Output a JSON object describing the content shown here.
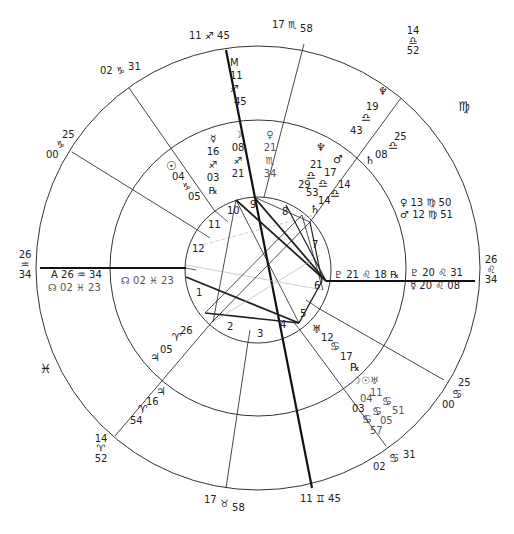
{
  "chart_title": "",
  "wheel": {
    "center": [
      258,
      268
    ],
    "outer_radius": 222,
    "middle_radius": 148,
    "inner_radius": 73,
    "line_color": "#222222",
    "background": "#ffffff"
  },
  "outer_cusps": [
    {
      "id": "mc",
      "deg": "11",
      "sign": "♐",
      "min": "45",
      "x": 200,
      "y": 32
    },
    {
      "id": "c11",
      "deg": "17",
      "sign": "♏",
      "min": "58",
      "x": 324,
      "y": 16
    },
    {
      "id": "c12",
      "deg": "14",
      "sign": "♎",
      "min": "52",
      "x": 398,
      "y": 46
    },
    {
      "id": "c9",
      "deg": "02",
      "sign": "♑",
      "min": "31",
      "x": 100,
      "y": 64
    },
    {
      "id": "c8",
      "deg": "00",
      "sign": "♑",
      "min": "25",
      "x": 46,
      "y": 130
    },
    {
      "id": "asc_left",
      "deg": "26",
      "sign": "♒",
      "min": "34",
      "x": 18,
      "y": 258
    },
    {
      "id": "asc_right",
      "deg": "26",
      "sign": "♌",
      "min": "34",
      "x": 482,
      "y": 266
    },
    {
      "id": "c5",
      "deg": "14",
      "sign": "♈",
      "min": "52",
      "x": 92,
      "y": 432
    },
    {
      "id": "c4b",
      "deg": "17",
      "sign": "♉",
      "min": "58",
      "x": 206,
      "y": 492
    },
    {
      "id": "ic",
      "deg": "11",
      "sign": "♊",
      "min": "45",
      "x": 276,
      "y": 494
    },
    {
      "id": "c2",
      "deg": "02",
      "sign": "♋",
      "min": "31",
      "x": 376,
      "y": 452
    },
    {
      "id": "c3",
      "deg": "00",
      "sign": "♋",
      "min": "25",
      "x": 444,
      "y": 396
    }
  ],
  "sign_markers": [
    {
      "sign": "♍",
      "x": 456,
      "y": 104
    },
    {
      "sign": "♓",
      "x": 42,
      "y": 362
    }
  ],
  "mc_label": {
    "text": "M",
    "deg": "11",
    "sign": "♐",
    "min": "45"
  },
  "asc_label": {
    "text": "A",
    "deg": "26",
    "sign": "♒",
    "min": "34"
  },
  "planets": [
    {
      "name": "mercury",
      "glyph": "☿",
      "deg": "16",
      "sign": "♐",
      "min": "03",
      "retro": "℞"
    },
    {
      "name": "moon",
      "glyph": "☽",
      "deg": "08",
      "sign": "♐",
      "min": "21"
    },
    {
      "name": "venus",
      "glyph": "♀",
      "deg": "21",
      "sign": "♏",
      "min": "34"
    },
    {
      "name": "sun",
      "glyph": "☉",
      "deg": "04",
      "sign": "♑",
      "min": "05"
    },
    {
      "name": "neptune",
      "glyph": "♆",
      "deg": "21",
      "sign": "♎",
      "min": "29"
    },
    {
      "name": "mars",
      "glyph": "♂",
      "deg": "17",
      "sign": "♎",
      "min": "53"
    },
    {
      "name": "saturn",
      "glyph": "♄",
      "deg": "14",
      "sign": "♎",
      "min": "14"
    },
    {
      "name": "pluto",
      "glyph": "♇",
      "deg": "21",
      "sign": "♌",
      "min": "18",
      "retro": "℞"
    },
    {
      "name": "uranus",
      "glyph": "♅",
      "deg": "12",
      "sign": "♋",
      "min": "17",
      "retro": "℞"
    },
    {
      "name": "jupiter",
      "glyph": "♃",
      "deg": "05",
      "sign": "♈",
      "min": "26"
    },
    {
      "name": "node",
      "glyph": "☊",
      "deg": "02",
      "sign": "♓",
      "min": "23"
    }
  ],
  "outer_ring_planets": [
    {
      "name": "neptune_t",
      "glyph": "♆",
      "deg": "19",
      "sign": "♎",
      "min": "43"
    },
    {
      "name": "saturn_t",
      "glyph": "♄",
      "deg": "08",
      "sign": "♎",
      "min": "25"
    },
    {
      "name": "venus_t",
      "glyph": "♀",
      "deg": "13",
      "sign": "♍",
      "min": "50"
    },
    {
      "name": "mars_t",
      "glyph": "♂",
      "deg": "12",
      "sign": "♍",
      "min": "51"
    },
    {
      "name": "pluto_t",
      "glyph": "♇",
      "deg": "20",
      "sign": "♌",
      "min": "31"
    },
    {
      "name": "mercury_t",
      "glyph": "☿",
      "deg": "20",
      "sign": "♌",
      "min": "08"
    },
    {
      "name": "jupiter_t",
      "glyph": "♃",
      "deg": "16",
      "sign": "♈",
      "min": "54"
    },
    {
      "name": "node_t",
      "glyph": "☊",
      "deg": "02",
      "sign": "♓",
      "min": "23"
    },
    {
      "name": "moon_t",
      "glyph": "☽",
      "deg": "03",
      "sign": "♋",
      "min": "57"
    },
    {
      "name": "sun_t",
      "glyph": "☉",
      "deg": "04",
      "sign": "♋",
      "min": "05"
    },
    {
      "name": "uranus_t",
      "glyph": "♅",
      "deg": "11",
      "sign": "♋",
      "min": "51"
    }
  ],
  "house_numbers": [
    "1",
    "2",
    "3",
    "4",
    "5",
    "6",
    "7",
    "8",
    "9",
    "10",
    "11",
    "12"
  ],
  "labels": {
    "mc_m": "M",
    "mc_deg": "11",
    "mc_sign": "♐",
    "mc_min": "45",
    "asc_a": "A",
    "asc_deg": "26",
    "asc_sign": "♒",
    "asc_min": "34",
    "node_inner": "☊ 02 ♓ 23",
    "node_outer": "☊ 02 ♓ 23",
    "pluto_row": "♇ 21 ♌ 18 ℞",
    "t_pluto_row": "♇ 20 ♌ 31",
    "t_merc_row": "☿ 20 ♌ 08",
    "venus_t_row": "♀ 13 ♍ 50",
    "mars_t_row": "♂ 12 ♍ 51",
    "uranus_glyph": "♅",
    "uranus_deg": "12",
    "uranus_sign": "♋",
    "uranus_min": "17",
    "uranus_retro": "℞",
    "sun_glyph": "☉",
    "sun_deg": "04",
    "sun_sign": "♑",
    "sun_min": "05",
    "merc_glyph": "☿",
    "merc_deg": "16",
    "merc_sign": "♐",
    "merc_min": "03",
    "merc_retro": "℞",
    "moon_glyph": "☽",
    "moon_deg": "08",
    "moon_sign": "♐",
    "moon_min": "21",
    "venus_glyph": "♀",
    "venus_deg": "21",
    "venus_sign": "♏",
    "venus_min": "34",
    "nep_glyph": "♆",
    "nep_deg": "21",
    "mars_glyph": "♂",
    "mars_deg": "17",
    "libra": "♎",
    "nep_min": "29",
    "mars_min": "53",
    "sat_deg": "14",
    "sat_min": "14",
    "sat_glyph": "♄",
    "nep_t_glyph": "♆",
    "nep_t_deg": "19",
    "nep_t_min": "43",
    "sat_t_glyph": "♄",
    "sat_t_deg": "08",
    "sat_t_min": "25",
    "jup_glyph": "♃",
    "jup_deg": "05",
    "aries": "♈",
    "jup_min": "26",
    "jup_t_glyph": "♃",
    "jup_t_deg": "16",
    "jup_t_min": "54",
    "cancer": "♋",
    "cancer_cluster_a": "☽☉♅",
    "cancer_cluster_b": "11",
    "cancer_cluster_c": "04",
    "cancer_cluster_d": "03",
    "cancer_cluster_e": "51",
    "cancer_cluster_f": "05",
    "cancer_cluster_g": "57"
  }
}
